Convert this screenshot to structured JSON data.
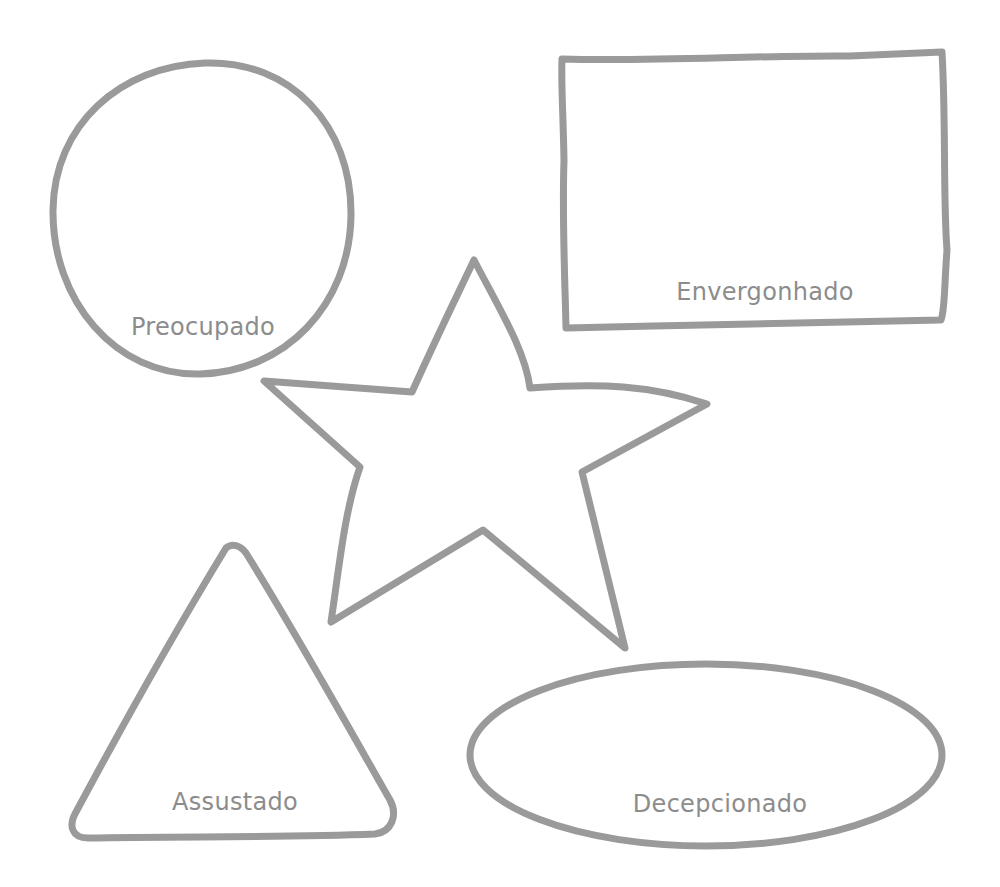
{
  "colors": {
    "stroke": "#9a9a9a",
    "label": "#8c8c8c",
    "background": "#ffffff"
  },
  "shapes": [
    {
      "type": "circle",
      "label": "Preocupado"
    },
    {
      "type": "rectangle",
      "label": "Envergonhado"
    },
    {
      "type": "star",
      "label": ""
    },
    {
      "type": "triangle",
      "label": "Assustado"
    },
    {
      "type": "ellipse",
      "label": "Decepcionado"
    }
  ]
}
